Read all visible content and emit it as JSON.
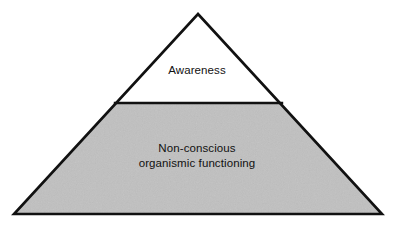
{
  "diagram": {
    "type": "pyramid",
    "title": "",
    "background_color": "#ffffff",
    "outline_color": "#111111",
    "geometry": {
      "apex": [
        198,
        14
      ],
      "base_left": [
        14,
        214
      ],
      "base_right": [
        382,
        214
      ],
      "divider_y": 103,
      "divider_left_x": 116,
      "divider_right_x": 281
    },
    "layers": [
      {
        "name": "awareness",
        "label": "Awareness",
        "fill_color": "#ffffff",
        "text_color": "#111111",
        "position": "top"
      },
      {
        "name": "non-conscious-organismic-functioning",
        "label": "Non-conscious\norganismic functioning",
        "fill_color": "#c0c0c0",
        "text_color": "#111111",
        "position": "bottom"
      }
    ]
  }
}
